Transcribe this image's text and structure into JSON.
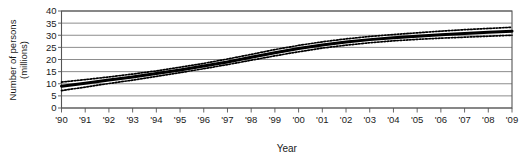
{
  "chart_data": {
    "type": "line",
    "title": "",
    "xlabel": "Year",
    "ylabel": "Number of persons (millions)",
    "ylabel_line1": "Number of persons",
    "ylabel_line2": "(millions)",
    "grid": true,
    "legend": "none",
    "xlim": [
      1990,
      2009
    ],
    "ylim": [
      0,
      40
    ],
    "ytick_values": [
      0,
      5,
      10,
      15,
      20,
      25,
      30,
      35,
      40
    ],
    "ytick_labels": [
      "0",
      "5",
      "10",
      "15",
      "20",
      "25",
      "30",
      "35",
      "40"
    ],
    "x": [
      1990,
      1991,
      1992,
      1993,
      1994,
      1995,
      1996,
      1997,
      1998,
      1999,
      2000,
      2001,
      2002,
      2003,
      2004,
      2005,
      2006,
      2007,
      2008,
      2009
    ],
    "xtick_labels": [
      "'90",
      "'91",
      "'92",
      "'93",
      "'94",
      "'95",
      "'96",
      "'97",
      "'98",
      "'99",
      "'00",
      "'01",
      "'02",
      "'03",
      "'04",
      "'05",
      "'06",
      "'07",
      "'08",
      "'09"
    ],
    "series": [
      {
        "name": "estimate",
        "style": "solid-thick",
        "color": "#000000",
        "values": [
          9.0,
          10.2,
          11.5,
          12.8,
          14.2,
          15.7,
          17.3,
          19.0,
          20.9,
          22.8,
          24.5,
          26.0,
          27.2,
          28.2,
          29.0,
          29.6,
          30.2,
          30.7,
          31.2,
          31.7
        ]
      },
      {
        "name": "upper-bound",
        "style": "dotted",
        "color": "#000000",
        "values": [
          10.7,
          11.7,
          12.8,
          14.0,
          15.3,
          16.8,
          18.4,
          20.2,
          22.1,
          24.1,
          25.8,
          27.3,
          28.5,
          29.5,
          30.3,
          31.0,
          31.7,
          32.3,
          32.8,
          33.3
        ]
      },
      {
        "name": "lower-bound",
        "style": "dotted",
        "color": "#000000",
        "values": [
          7.2,
          8.6,
          10.1,
          11.5,
          13.0,
          14.6,
          16.2,
          17.9,
          19.7,
          21.5,
          23.2,
          24.7,
          25.9,
          26.9,
          27.7,
          28.3,
          28.8,
          29.2,
          29.6,
          30.0
        ]
      }
    ],
    "colors": {
      "line": "#000000",
      "grid": "#808080",
      "axis": "#555555",
      "background": "#ffffff"
    }
  }
}
